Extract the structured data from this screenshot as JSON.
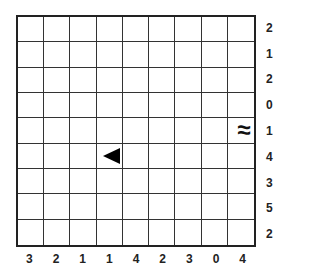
{
  "puzzle": {
    "rows": 9,
    "cols": 9,
    "row_clues": [
      "2",
      "1",
      "2",
      "0",
      "1",
      "4",
      "3",
      "5",
      "2"
    ],
    "col_clues": [
      "3",
      "2",
      "1",
      "1",
      "4",
      "2",
      "3",
      "0",
      "4"
    ],
    "given_cells": [
      {
        "row": 4,
        "col": 8,
        "type": "water",
        "icon": "waves-icon",
        "glyph": "≈"
      },
      {
        "row": 5,
        "col": 3,
        "type": "ship-end-left",
        "icon": "ship-end-left-icon",
        "glyph": "◀"
      }
    ]
  }
}
